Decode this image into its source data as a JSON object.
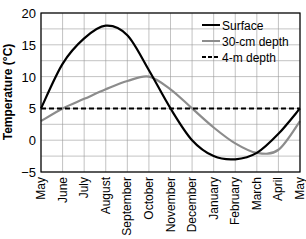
{
  "chart_data": {
    "type": "line",
    "title": "",
    "xlabel": "",
    "ylabel": "Temperature (°C)",
    "ylim": [
      -5,
      20
    ],
    "yticks": [
      -5,
      0,
      5,
      10,
      15,
      20
    ],
    "grid": true,
    "legend_position": "upper right",
    "categories": [
      "May",
      "June",
      "July",
      "August",
      "September",
      "October",
      "November",
      "December",
      "January",
      "February",
      "March",
      "April",
      "May"
    ],
    "series": [
      {
        "name": "Surface",
        "color": "#000000",
        "style": "solid",
        "values": [
          5,
          12,
          16,
          18,
          16.5,
          11,
          5,
          0,
          -2.5,
          -3,
          -2,
          1,
          5
        ]
      },
      {
        "name": "30-cm depth",
        "color": "#8c8c8c",
        "style": "solid",
        "values": [
          3,
          5,
          6.5,
          8,
          9.3,
          10,
          8,
          5,
          2,
          -0.5,
          -2,
          -1.5,
          3
        ]
      },
      {
        "name": "4-m depth",
        "color": "#000000",
        "style": "dashed",
        "values": [
          5,
          5,
          5,
          5,
          5,
          5,
          5,
          5,
          5,
          5,
          5,
          5,
          5
        ]
      }
    ]
  }
}
